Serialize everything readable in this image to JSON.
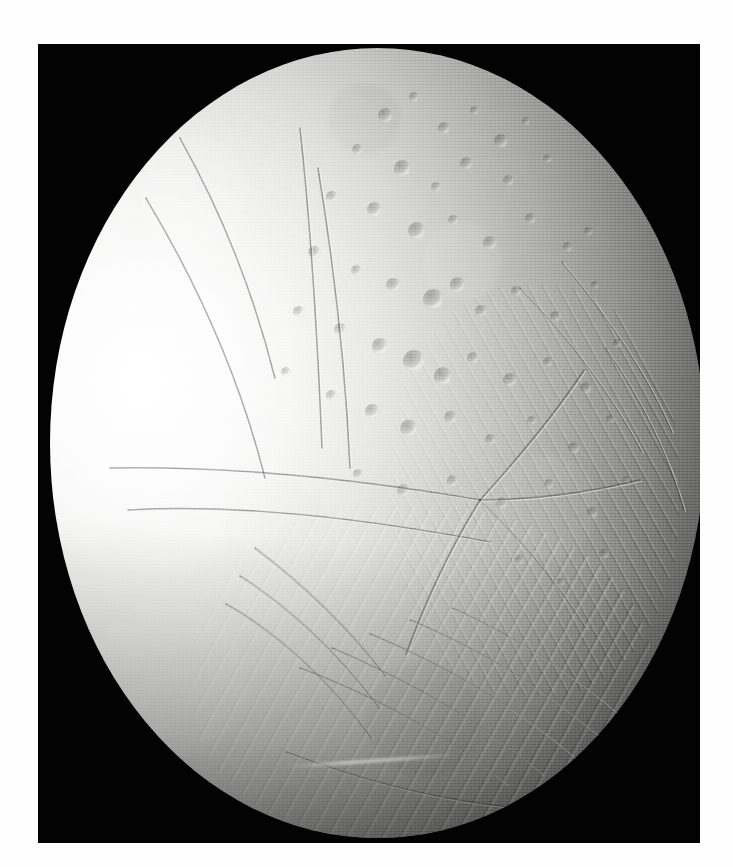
{
  "image": {
    "subject": "Enceladus",
    "subject_type": "icy moon of Saturn",
    "view_description": "Full illuminated crescent-to-gibbous disk of Enceladus centered in a black photographic frame on a white page",
    "alt_text": "Grayscale spacecraft photograph of Saturn's moon Enceladus showing a bright smooth western limb, a heavily cratered northern region, and grooved fractured terrain toward the south",
    "background_color": "#030303",
    "page_color": "#ffffff",
    "frame": {
      "x": 38,
      "y": 44,
      "width": 662,
      "height": 799
    },
    "disk": {
      "x": 50,
      "y": 48,
      "width": 655,
      "height": 790
    },
    "lighting": {
      "illumination_direction": "from the left (west)",
      "terminator_side": "right (east)",
      "brightest_value": "#ffffff",
      "darkest_value": "#040404"
    },
    "terrain_regions": [
      {
        "name": "smooth-bright-plains",
        "location": "western limb",
        "tone": "#fdfdfd"
      },
      {
        "name": "cratered-northern-terrain",
        "location": "upper center and upper right",
        "tone": "#b9b9b6"
      },
      {
        "name": "radial-fracture-junction",
        "location": "center right",
        "tone": "#9a9a98"
      },
      {
        "name": "grooved-south-polar-terrain",
        "location": "lower center and lower right",
        "tone": "#8e8e8c"
      },
      {
        "name": "terminator-shadow",
        "location": "far right limb",
        "tone": "#131312"
      }
    ]
  },
  "chart_data": {
    "type": "scatter",
    "craters": [
      {
        "cx": 0.512,
        "cy": 0.085,
        "r": 0.0115,
        "depth": 0.55
      },
      {
        "cx": 0.556,
        "cy": 0.062,
        "r": 0.0075,
        "depth": 0.45
      },
      {
        "cx": 0.601,
        "cy": 0.101,
        "r": 0.0092,
        "depth": 0.5
      },
      {
        "cx": 0.648,
        "cy": 0.079,
        "r": 0.0068,
        "depth": 0.4
      },
      {
        "cx": 0.688,
        "cy": 0.118,
        "r": 0.0105,
        "depth": 0.52
      },
      {
        "cx": 0.727,
        "cy": 0.092,
        "r": 0.006,
        "depth": 0.38
      },
      {
        "cx": 0.47,
        "cy": 0.129,
        "r": 0.0085,
        "depth": 0.46
      },
      {
        "cx": 0.538,
        "cy": 0.152,
        "r": 0.013,
        "depth": 0.58
      },
      {
        "cx": 0.589,
        "cy": 0.176,
        "r": 0.0073,
        "depth": 0.42
      },
      {
        "cx": 0.636,
        "cy": 0.146,
        "r": 0.0098,
        "depth": 0.49
      },
      {
        "cx": 0.7,
        "cy": 0.168,
        "r": 0.008,
        "depth": 0.44
      },
      {
        "cx": 0.76,
        "cy": 0.14,
        "r": 0.0067,
        "depth": 0.36
      },
      {
        "cx": 0.43,
        "cy": 0.188,
        "r": 0.009,
        "depth": 0.47
      },
      {
        "cx": 0.495,
        "cy": 0.205,
        "r": 0.0115,
        "depth": 0.53
      },
      {
        "cx": 0.56,
        "cy": 0.232,
        "r": 0.014,
        "depth": 0.6
      },
      {
        "cx": 0.616,
        "cy": 0.218,
        "r": 0.0078,
        "depth": 0.43
      },
      {
        "cx": 0.672,
        "cy": 0.247,
        "r": 0.0105,
        "depth": 0.5
      },
      {
        "cx": 0.734,
        "cy": 0.216,
        "r": 0.0085,
        "depth": 0.41
      },
      {
        "cx": 0.79,
        "cy": 0.252,
        "r": 0.0072,
        "depth": 0.37
      },
      {
        "cx": 0.404,
        "cy": 0.259,
        "r": 0.0095,
        "depth": 0.46
      },
      {
        "cx": 0.468,
        "cy": 0.282,
        "r": 0.0082,
        "depth": 0.44
      },
      {
        "cx": 0.524,
        "cy": 0.3,
        "r": 0.0112,
        "depth": 0.51
      },
      {
        "cx": 0.585,
        "cy": 0.318,
        "r": 0.0158,
        "depth": 0.64
      },
      {
        "cx": 0.622,
        "cy": 0.3,
        "r": 0.0118,
        "depth": 0.55
      },
      {
        "cx": 0.658,
        "cy": 0.333,
        "r": 0.0096,
        "depth": 0.48
      },
      {
        "cx": 0.712,
        "cy": 0.308,
        "r": 0.0079,
        "depth": 0.4
      },
      {
        "cx": 0.772,
        "cy": 0.34,
        "r": 0.0088,
        "depth": 0.42
      },
      {
        "cx": 0.832,
        "cy": 0.3,
        "r": 0.0066,
        "depth": 0.34
      },
      {
        "cx": 0.38,
        "cy": 0.334,
        "r": 0.0086,
        "depth": 0.43
      },
      {
        "cx": 0.444,
        "cy": 0.356,
        "r": 0.0101,
        "depth": 0.47
      },
      {
        "cx": 0.504,
        "cy": 0.378,
        "r": 0.0125,
        "depth": 0.54
      },
      {
        "cx": 0.556,
        "cy": 0.396,
        "r": 0.017,
        "depth": 0.66
      },
      {
        "cx": 0.6,
        "cy": 0.416,
        "r": 0.0142,
        "depth": 0.58
      },
      {
        "cx": 0.646,
        "cy": 0.392,
        "r": 0.009,
        "depth": 0.45
      },
      {
        "cx": 0.702,
        "cy": 0.42,
        "r": 0.0108,
        "depth": 0.49
      },
      {
        "cx": 0.76,
        "cy": 0.398,
        "r": 0.0076,
        "depth": 0.38
      },
      {
        "cx": 0.818,
        "cy": 0.43,
        "r": 0.0094,
        "depth": 0.41
      },
      {
        "cx": 0.36,
        "cy": 0.41,
        "r": 0.0074,
        "depth": 0.38
      },
      {
        "cx": 0.43,
        "cy": 0.44,
        "r": 0.0089,
        "depth": 0.42
      },
      {
        "cx": 0.492,
        "cy": 0.46,
        "r": 0.0112,
        "depth": 0.48
      },
      {
        "cx": 0.548,
        "cy": 0.482,
        "r": 0.0132,
        "depth": 0.55
      },
      {
        "cx": 0.612,
        "cy": 0.468,
        "r": 0.0098,
        "depth": 0.45
      },
      {
        "cx": 0.672,
        "cy": 0.496,
        "r": 0.0086,
        "depth": 0.4
      },
      {
        "cx": 0.736,
        "cy": 0.472,
        "r": 0.007,
        "depth": 0.35
      },
      {
        "cx": 0.8,
        "cy": 0.506,
        "r": 0.0092,
        "depth": 0.4
      },
      {
        "cx": 0.856,
        "cy": 0.47,
        "r": 0.0064,
        "depth": 0.32
      },
      {
        "cx": 0.47,
        "cy": 0.54,
        "r": 0.008,
        "depth": 0.4
      },
      {
        "cx": 0.54,
        "cy": 0.56,
        "r": 0.01,
        "depth": 0.44
      },
      {
        "cx": 0.614,
        "cy": 0.548,
        "r": 0.0086,
        "depth": 0.39
      },
      {
        "cx": 0.69,
        "cy": 0.576,
        "r": 0.0094,
        "depth": 0.4
      },
      {
        "cx": 0.762,
        "cy": 0.552,
        "r": 0.0072,
        "depth": 0.34
      },
      {
        "cx": 0.828,
        "cy": 0.588,
        "r": 0.0082,
        "depth": 0.35
      },
      {
        "cx": 0.88,
        "cy": 0.546,
        "r": 0.0058,
        "depth": 0.3
      },
      {
        "cx": 0.822,
        "cy": 0.232,
        "r": 0.007,
        "depth": 0.34
      },
      {
        "cx": 0.866,
        "cy": 0.374,
        "r": 0.0062,
        "depth": 0.3
      },
      {
        "cx": 0.846,
        "cy": 0.64,
        "r": 0.0076,
        "depth": 0.32
      },
      {
        "cx": 0.78,
        "cy": 0.676,
        "r": 0.0068,
        "depth": 0.3
      },
      {
        "cx": 0.716,
        "cy": 0.648,
        "r": 0.008,
        "depth": 0.34
      }
    ],
    "fractures": [
      {
        "name": "northwest-linea",
        "d": "M 130 90 C 175 170, 205 250, 225 330"
      },
      {
        "name": "west-linea",
        "d": "M 96 150 C 150 240, 190 330, 215 430"
      },
      {
        "name": "central-linea",
        "d": "M 250 80 C 262 190, 268 300, 272 400"
      },
      {
        "name": "central-linea-b",
        "d": "M 268 120 C 286 230, 296 330, 300 420"
      },
      {
        "name": "equator-fracture",
        "d": "M 60 420 C 170 418, 300 430, 430 452"
      },
      {
        "name": "equator-fracture-b",
        "d": "M 78 462 C 190 456, 310 470, 440 494"
      },
      {
        "name": "radial-branch-1",
        "d": "M 430 452 C 470 408, 505 366, 534 322"
      },
      {
        "name": "radial-branch-2",
        "d": "M 430 452 C 478 452, 532 446, 590 432"
      },
      {
        "name": "radial-branch-3",
        "d": "M 430 452 C 472 492, 508 534, 536 580"
      },
      {
        "name": "radial-branch-4",
        "d": "M 430 452 C 400 500, 376 552, 356 606"
      },
      {
        "name": "fan-fracture-1",
        "d": "M 205 500 C 250 534, 296 576, 336 628"
      },
      {
        "name": "fan-fracture-2",
        "d": "M 190 528 C 238 558, 288 604, 330 660"
      },
      {
        "name": "fan-fracture-3",
        "d": "M 176 556 C 226 584, 278 630, 322 690"
      },
      {
        "name": "south-groove-1",
        "d": "M 250 620 C 318 646, 392 684, 456 736"
      },
      {
        "name": "south-groove-2",
        "d": "M 282 600 C 352 630, 428 672, 492 726"
      },
      {
        "name": "south-groove-3",
        "d": "M 320 586 C 392 616, 468 660, 532 716"
      },
      {
        "name": "south-groove-4",
        "d": "M 360 572 C 432 602, 506 648, 566 704"
      },
      {
        "name": "south-groove-5",
        "d": "M 402 560 C 472 592, 542 638, 596 692"
      },
      {
        "name": "south-rim-ridge",
        "d": "M 236 704 C 320 736, 408 758, 498 762"
      },
      {
        "name": "east-groove-1",
        "d": "M 470 240 C 520 290, 560 344, 592 404"
      },
      {
        "name": "east-groove-2",
        "d": "M 512 214 C 558 268, 596 324, 622 384"
      },
      {
        "name": "east-groove-3",
        "d": "M 556 300 C 592 352, 618 406, 634 462"
      }
    ]
  }
}
